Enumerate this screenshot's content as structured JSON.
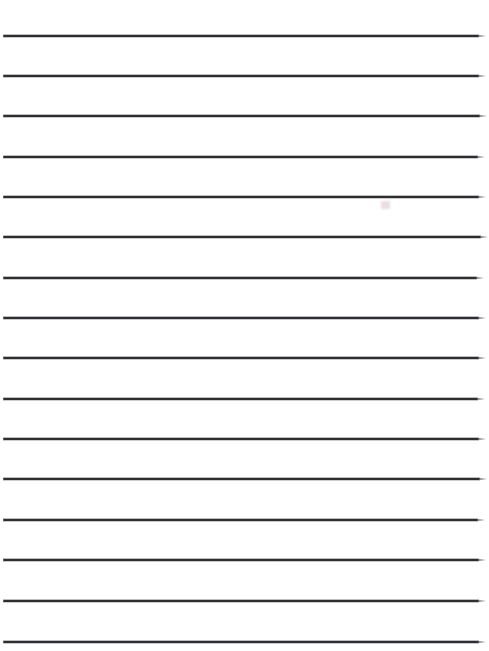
{
  "document": {
    "kind": "lined-writing-paper",
    "title": "Blank lined paper",
    "page_width": 489,
    "page_height": 651,
    "background_color": "#ffffff",
    "rule_color": "#2e2e30",
    "rule_thickness": 2,
    "rule_count": 16,
    "rule_spacing": 40.4,
    "rule_left_x": 3,
    "rule_right_x": 479,
    "content_text": "",
    "lines": [
      {
        "index": 1,
        "y": 35,
        "left": 3,
        "right": 479,
        "text": ""
      },
      {
        "index": 2,
        "y": 75,
        "left": 3,
        "right": 479,
        "text": ""
      },
      {
        "index": 3,
        "y": 115,
        "left": 3,
        "right": 480,
        "text": ""
      },
      {
        "index": 4,
        "y": 156,
        "left": 3,
        "right": 478,
        "text": ""
      },
      {
        "index": 5,
        "y": 196,
        "left": 3,
        "right": 479,
        "text": ""
      },
      {
        "index": 6,
        "y": 236,
        "left": 3,
        "right": 481,
        "text": ""
      },
      {
        "index": 7,
        "y": 277,
        "left": 3,
        "right": 477,
        "text": ""
      },
      {
        "index": 8,
        "y": 317,
        "left": 3,
        "right": 479,
        "text": ""
      },
      {
        "index": 9,
        "y": 357,
        "left": 3,
        "right": 479,
        "text": ""
      },
      {
        "index": 10,
        "y": 398,
        "left": 3,
        "right": 478,
        "text": ""
      },
      {
        "index": 11,
        "y": 438,
        "left": 3,
        "right": 479,
        "text": ""
      },
      {
        "index": 12,
        "y": 478,
        "left": 3,
        "right": 480,
        "text": ""
      },
      {
        "index": 13,
        "y": 519,
        "left": 3,
        "right": 478,
        "text": ""
      },
      {
        "index": 14,
        "y": 559,
        "left": 3,
        "right": 479,
        "text": ""
      },
      {
        "index": 15,
        "y": 600,
        "left": 3,
        "right": 479,
        "text": ""
      },
      {
        "index": 16,
        "y": 641,
        "left": 3,
        "right": 479,
        "text": ""
      }
    ],
    "artifacts": [
      {
        "name": "scan-smudge",
        "x": 381,
        "y": 201,
        "width": 9,
        "height": 8,
        "color": "#d6c4ce"
      }
    ]
  }
}
